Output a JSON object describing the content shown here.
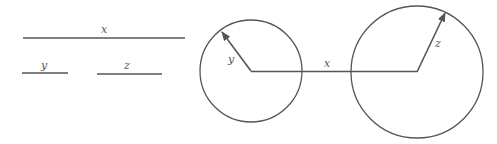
{
  "legend": {
    "x_label": "x",
    "y_label": "y",
    "z_label": "z"
  },
  "left_circle": {
    "radius_label": "y"
  },
  "right_circle": {
    "radius_label": "z"
  },
  "connector": {
    "label": "x"
  },
  "colors": {
    "stroke": "#555555",
    "background": "#ffffff"
  }
}
